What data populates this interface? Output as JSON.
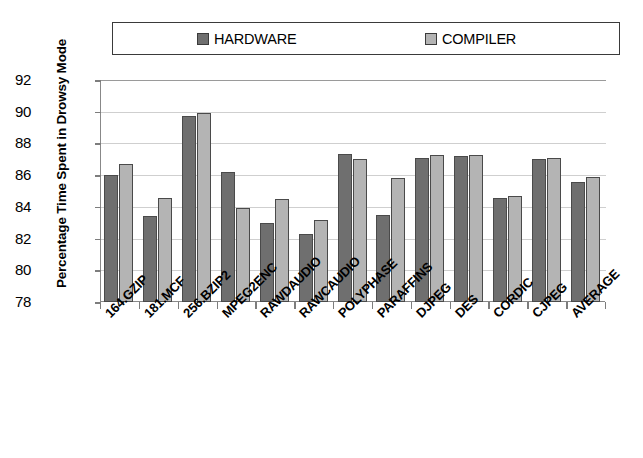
{
  "chart_data": {
    "type": "bar",
    "title": "",
    "xlabel": "",
    "ylabel": "Percentage Time Spent in Drowsy Mode",
    "ylim": [
      78,
      92
    ],
    "ytick_step": 2,
    "yticks": [
      92,
      90,
      88,
      86,
      84,
      82,
      80,
      78
    ],
    "grid": true,
    "legend_position": "top",
    "categories": [
      "164.GZIP",
      "181.MCF",
      "256.BZIP2",
      "MPEG2ENC",
      "RAWDAUDIO",
      "RAWCAUDIO",
      "POLYPHASE",
      "PARAFFINS",
      "DJPEG",
      "DES",
      "CORDIC",
      "CJPEG",
      "AVERAGE"
    ],
    "series": [
      {
        "name": "HARDWARE",
        "color": "#6f6f6f",
        "values": [
          86.0,
          83.45,
          89.7,
          86.2,
          83.0,
          82.3,
          87.35,
          83.5,
          87.1,
          87.2,
          84.55,
          87.05,
          85.55
        ]
      },
      {
        "name": "COMPILER",
        "color": "#b4b4b4",
        "values": [
          86.7,
          84.55,
          89.9,
          83.9,
          84.5,
          83.2,
          87.0,
          85.85,
          87.25,
          87.3,
          84.7,
          87.1,
          85.9
        ]
      }
    ]
  },
  "legend": {
    "entries": [
      {
        "label": "HARDWARE",
        "swatch_color": "#6f6f6f",
        "icon": "legend-swatch-icon"
      },
      {
        "label": "COMPILER",
        "swatch_color": "#b4b4b4",
        "icon": "legend-swatch-icon"
      }
    ]
  },
  "axes": {
    "y_title": "Percentage Time Spent in Drowsy Mode",
    "y_tick_labels": [
      "92",
      "90",
      "88",
      "86",
      "84",
      "82",
      "80",
      "78"
    ],
    "x_tick_labels": [
      "164.GZIP",
      "181.MCF",
      "256.BZIP2",
      "MPEG2ENC",
      "RAWDAUDIO",
      "RAWCAUDIO",
      "POLYPHASE",
      "PARAFFINS",
      "DJPEG",
      "DES",
      "CORDIC",
      "CJPEG",
      "AVERAGE"
    ]
  },
  "colors": {
    "hardware": "#6f6f6f",
    "compiler": "#b4b4b4",
    "axis": "#888888",
    "grid": "#cfcfcf",
    "border": "#3a3a3a",
    "background": "#ffffff"
  }
}
